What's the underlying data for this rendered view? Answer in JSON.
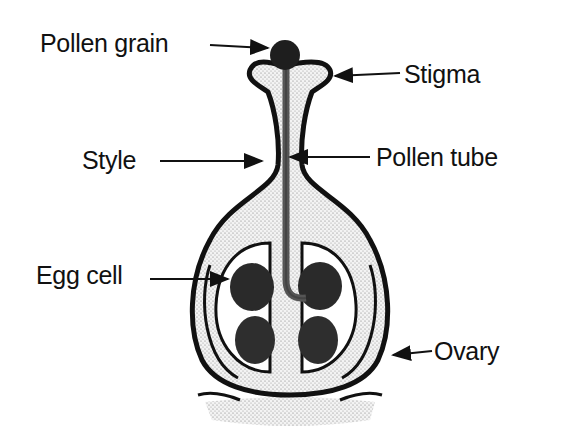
{
  "diagram": {
    "labels": {
      "pollen_grain": "Pollen grain",
      "stigma": "Stigma",
      "style": "Style",
      "pollen_tube": "Pollen tube",
      "egg_cell": "Egg cell",
      "ovary": "Ovary"
    },
    "colors": {
      "outline": "#111111",
      "fill_stipple": "#e6e6e6",
      "cell_dark": "#2a2a2a",
      "background": "#ffffff"
    }
  }
}
